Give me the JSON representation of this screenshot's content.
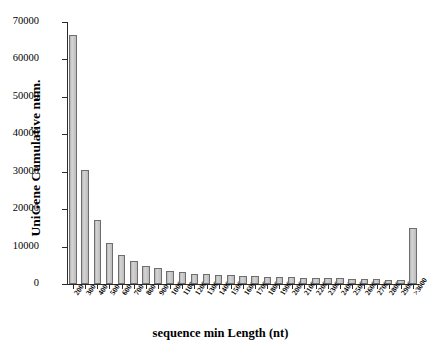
{
  "chart_data": {
    "type": "bar",
    "title": "",
    "xlabel": "sequence min Length (nt)",
    "ylabel": "UniGene Cumulative num.",
    "ylim": [
      0,
      70000
    ],
    "ytick_values": [
      0,
      10000,
      20000,
      30000,
      40000,
      50000,
      60000,
      70000
    ],
    "ytick_labels": [
      "0",
      "10000",
      "20000",
      "30000",
      "40000",
      "50000",
      "60000",
      "70000"
    ],
    "grid": false,
    "legend": null,
    "bar_color": "#c9c9c9",
    "bar_edge_color": "#6e6e6e",
    "categories": [
      "200",
      "300",
      "400",
      "500",
      "600",
      "700",
      "800",
      "900",
      "1000",
      "1100",
      "1200",
      "1300",
      "1400",
      "1500",
      "1600",
      "1700",
      "1800",
      "1900",
      "2000",
      "2100",
      "2200",
      "2300",
      "2400",
      "2500",
      "2600",
      "2700",
      "2800",
      "2900",
      ">3000"
    ],
    "values": [
      66600,
      30500,
      17000,
      11000,
      7800,
      6100,
      4900,
      4200,
      3500,
      3200,
      2700,
      2600,
      2400,
      2300,
      2200,
      2100,
      2000,
      1900,
      1800,
      1700,
      1600,
      1550,
      1500,
      1400,
      1300,
      1250,
      1150,
      1000,
      15000
    ]
  }
}
